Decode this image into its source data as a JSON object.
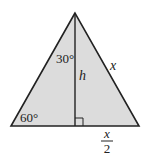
{
  "diagram": {
    "type": "equilateral-triangle-altitude",
    "labels": {
      "top_angle": "30°",
      "bottom_left_angle": "60°",
      "altitude": "h",
      "side": "x",
      "half_base_numerator": "x",
      "half_base_denominator": "2"
    },
    "colors": {
      "fill": "#dcdcdc",
      "stroke": "#222222"
    }
  }
}
